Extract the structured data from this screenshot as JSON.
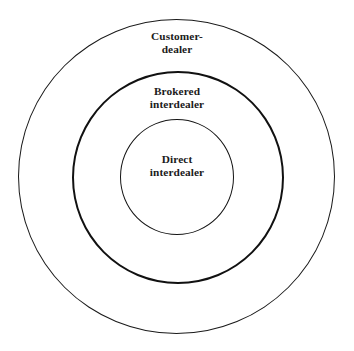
{
  "diagram": {
    "type": "concentric-circles",
    "title": "",
    "background_color": "#ffffff",
    "stroke_color": "#1a1a1a",
    "rings": [
      {
        "id": "customer-dealer",
        "level": "outer",
        "label_line1": "Customer-",
        "label_line2": "dealer",
        "stroke_width_px": 1,
        "diameter_px": 317
      },
      {
        "id": "brokered-interdealer",
        "level": "middle",
        "label_line1": "Brokered",
        "label_line2": "interdealer",
        "stroke_width_px": 2.6,
        "diameter_px": 212
      },
      {
        "id": "direct-interdealer",
        "level": "inner",
        "label_line1": "Direct",
        "label_line2": "interdealer",
        "stroke_width_px": 1.9,
        "diameter_px": 114
      }
    ]
  }
}
